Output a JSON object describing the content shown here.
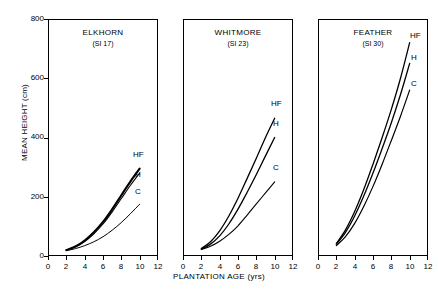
{
  "chart_data": {
    "type": "line",
    "title": "",
    "xlabel": "PLANTATION AGE (yrs)",
    "ylabel": "MEAN HEIGHT (cm)",
    "xlim": [
      0,
      12
    ],
    "ylim": [
      0,
      800
    ],
    "xticks": [
      0,
      2,
      4,
      6,
      8,
      10,
      12
    ],
    "yticks": [
      0,
      200,
      400,
      600,
      800
    ],
    "grid": false,
    "legend_position": "inline-right-of-curve-endpoint",
    "legend_entries": [
      "HF",
      "H",
      "C"
    ],
    "panels": [
      {
        "name": "ELKHORN",
        "subtitle": "(SI 17)",
        "x": [
          2,
          3,
          4,
          5,
          6,
          7,
          8,
          9,
          10
        ],
        "series": [
          {
            "name": "HF",
            "values": [
              20,
              32,
              52,
              80,
              115,
              158,
              205,
              252,
              295
            ]
          },
          {
            "name": "H",
            "values": [
              20,
              31,
              49,
              75,
              108,
              149,
              194,
              239,
              280
            ]
          },
          {
            "name": "C",
            "values": [
              18,
              25,
              35,
              48,
              65,
              87,
              113,
              143,
              175
            ]
          }
        ]
      },
      {
        "name": "WHITMORE",
        "subtitle": "(SI 23)",
        "x": [
          2,
          3,
          4,
          5,
          6,
          7,
          8,
          9,
          10
        ],
        "series": [
          {
            "name": "HF",
            "values": [
              25,
              48,
              85,
              135,
              195,
              262,
              330,
              400,
              465
            ]
          },
          {
            "name": "H",
            "values": [
              23,
              40,
              68,
              108,
              158,
              215,
              275,
              338,
              400
            ]
          },
          {
            "name": "C",
            "values": [
              22,
              33,
              50,
              73,
              102,
              138,
              176,
              213,
              250
            ]
          }
        ]
      },
      {
        "name": "FEATHER",
        "subtitle": "(SI 30)",
        "x": [
          2,
          3,
          4,
          5,
          6,
          7,
          8,
          9,
          10
        ],
        "series": [
          {
            "name": "HF",
            "values": [
              42,
              88,
              150,
              225,
              310,
              400,
              495,
              600,
              720
            ]
          },
          {
            "name": "H",
            "values": [
              40,
              80,
              135,
              203,
              280,
              363,
              450,
              545,
              650
            ]
          },
          {
            "name": "C",
            "values": [
              35,
              65,
              110,
              168,
              235,
              310,
              390,
              472,
              560
            ]
          }
        ]
      }
    ]
  },
  "axis": {
    "y_title": "MEAN HEIGHT (cm)",
    "x_title": "PLANTATION AGE (yrs)",
    "y_tick_labels": [
      "800",
      "600",
      "400",
      "200",
      "0"
    ],
    "x_tick_labels": [
      "0",
      "2",
      "4",
      "6",
      "8",
      "10",
      "12"
    ]
  },
  "panels": [
    {
      "title": "ELKHORN",
      "subtitle": "(SI 17)",
      "labels": {
        "hf": "HF",
        "h": "H",
        "c": "C"
      }
    },
    {
      "title": "WHITMORE",
      "subtitle": "(SI 23)",
      "labels": {
        "hf": "HF",
        "h": "H",
        "c": "C"
      }
    },
    {
      "title": "FEATHER",
      "subtitle": "(SI 30)",
      "labels": {
        "hf": "HF",
        "h": "H",
        "c": "C"
      }
    }
  ],
  "colors": {
    "ink": "#000000",
    "background": "#ffffff"
  }
}
